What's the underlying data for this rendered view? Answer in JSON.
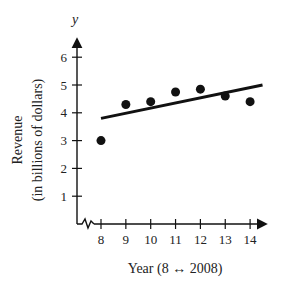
{
  "chart_data": {
    "type": "scatter",
    "title": "",
    "xlabel": "Year (8 ↔ 2008)",
    "ylabel": "Revenue",
    "ylabel_sub": "(in billions of dollars)",
    "y_axis_letter": "y",
    "x": [
      8,
      9,
      10,
      11,
      12,
      13,
      14
    ],
    "values": [
      3.0,
      4.3,
      4.4,
      4.75,
      4.85,
      4.6,
      4.4
    ],
    "trendline": {
      "x": [
        8,
        14.5
      ],
      "y": [
        3.8,
        5.0
      ]
    },
    "xticks": [
      "8",
      "9",
      "10",
      "11",
      "12",
      "13",
      "14"
    ],
    "yticks": [
      "1",
      "2",
      "3",
      "4",
      "5",
      "6"
    ],
    "xlim": [
      7,
      15
    ],
    "ylim": [
      0,
      6.5
    ],
    "grid": false,
    "legend": null,
    "axis_break": "x-axis zigzag near origin"
  }
}
